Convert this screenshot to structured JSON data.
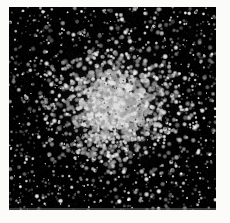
{
  "figure": {
    "kind": "astronomical-image",
    "subject_label": "globular star cluster",
    "title": "",
    "caption": "",
    "annotations": [],
    "axis_labels": [],
    "tick_labels": [],
    "legend": [],
    "scale_bar": ""
  },
  "canvas": {
    "page_width": 230,
    "page_height": 223,
    "page_background": "#fbfbfa",
    "field_left": 9,
    "field_top": 7,
    "field_width": 207,
    "field_height": 203,
    "field_background": "#000000"
  },
  "chart_data": {
    "type": "scatter",
    "title": "",
    "xlabel": "",
    "ylabel": "",
    "grid": false,
    "legend_position": "none",
    "xlim": [
      0,
      207
    ],
    "ylim": [
      0,
      203
    ],
    "series": [
      {
        "name": "cluster stars",
        "color": "#ffffff",
        "center_x": 107,
        "center_y": 99,
        "core_radius": 26,
        "half_light_radius": 48,
        "tidal_radius": 150,
        "count": 2600,
        "profile": "king",
        "point_size_px": [
          1,
          3
        ]
      },
      {
        "name": "field stars",
        "color": "#d0d0d0",
        "count": 900,
        "profile": "uniform",
        "point_size_px": [
          1,
          2
        ]
      }
    ]
  },
  "render": {
    "seed": 20240517,
    "core_glow_color": "#9a9a9a",
    "core_glow_opacity": 0.3,
    "star_min_gray": 70,
    "star_max_gray": 255
  }
}
